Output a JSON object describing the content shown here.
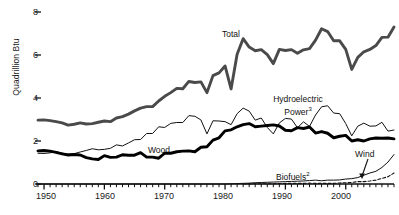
{
  "chart_data": {
    "type": "line",
    "title": "",
    "xlabel": "",
    "ylabel": "Quadrillion Btu",
    "xlim": [
      1949,
      2008
    ],
    "ylim": [
      0,
      8
    ],
    "yticks": [
      0,
      2,
      4,
      6,
      8
    ],
    "xticks": [
      1950,
      1960,
      1970,
      1980,
      1990,
      2000
    ],
    "minor_tick_interval": 1,
    "grid": false,
    "legend": "inline-annotations",
    "series": [
      {
        "name": "Total",
        "style": "thick-gray",
        "color": "#4a4a4a",
        "x": [
          1949,
          1950,
          1951,
          1952,
          1953,
          1954,
          1955,
          1956,
          1957,
          1958,
          1959,
          1960,
          1961,
          1962,
          1963,
          1964,
          1965,
          1966,
          1967,
          1968,
          1969,
          1970,
          1971,
          1972,
          1973,
          1974,
          1975,
          1976,
          1977,
          1978,
          1979,
          1980,
          1981,
          1982,
          1983,
          1984,
          1985,
          1986,
          1987,
          1988,
          1989,
          1990,
          1991,
          1992,
          1993,
          1994,
          1995,
          1996,
          1997,
          1998,
          1999,
          2000,
          2001,
          2002,
          2003,
          2004,
          2005,
          2006,
          2007,
          2008
        ],
        "values": [
          2.97,
          2.98,
          2.95,
          2.9,
          2.84,
          2.74,
          2.78,
          2.84,
          2.79,
          2.81,
          2.87,
          2.93,
          2.9,
          3.07,
          3.13,
          3.25,
          3.4,
          3.53,
          3.6,
          3.6,
          3.86,
          4.08,
          4.25,
          4.45,
          4.43,
          4.77,
          4.72,
          4.75,
          4.25,
          5.04,
          5.17,
          5.49,
          4.42,
          6.03,
          6.76,
          6.37,
          6.2,
          6.25,
          6.02,
          5.6,
          6.26,
          6.21,
          6.25,
          6.08,
          6.24,
          6.3,
          6.69,
          7.22,
          7.09,
          6.66,
          6.66,
          6.26,
          5.33,
          5.89,
          6.15,
          6.26,
          6.44,
          6.82,
          6.83,
          7.3
        ]
      },
      {
        "name": "Hydroelectric Power",
        "footnote": "3",
        "style": "thin-black",
        "color": "#111111",
        "x": [
          1949,
          1950,
          1951,
          1952,
          1953,
          1954,
          1955,
          1956,
          1957,
          1958,
          1959,
          1960,
          1961,
          1962,
          1963,
          1964,
          1965,
          1966,
          1967,
          1968,
          1969,
          1970,
          1971,
          1972,
          1973,
          1974,
          1975,
          1976,
          1977,
          1978,
          1979,
          1980,
          1981,
          1982,
          1983,
          1984,
          1985,
          1986,
          1987,
          1988,
          1989,
          1990,
          1991,
          1992,
          1993,
          1994,
          1995,
          1996,
          1997,
          1998,
          1999,
          2000,
          2001,
          2002,
          2003,
          2004,
          2005,
          2006,
          2007,
          2008
        ],
        "values": [
          1.43,
          1.42,
          1.45,
          1.5,
          1.44,
          1.39,
          1.41,
          1.49,
          1.56,
          1.64,
          1.59,
          1.61,
          1.66,
          1.82,
          1.77,
          1.91,
          2.06,
          2.07,
          2.35,
          2.35,
          2.66,
          2.63,
          2.82,
          2.86,
          2.86,
          3.18,
          3.15,
          2.98,
          2.33,
          2.94,
          2.93,
          2.9,
          2.76,
          3.27,
          3.53,
          3.39,
          2.97,
          3.07,
          2.63,
          2.33,
          2.84,
          3.05,
          3.02,
          2.62,
          2.89,
          2.68,
          3.21,
          3.59,
          3.64,
          3.3,
          3.27,
          2.81,
          2.24,
          2.69,
          2.83,
          2.69,
          2.7,
          2.87,
          2.46,
          2.51
        ]
      },
      {
        "name": "Wood",
        "style": "thick-black",
        "color": "#000000",
        "x": [
          1949,
          1950,
          1951,
          1952,
          1953,
          1954,
          1955,
          1956,
          1957,
          1958,
          1959,
          1960,
          1961,
          1962,
          1963,
          1964,
          1965,
          1966,
          1967,
          1968,
          1969,
          1970,
          1971,
          1972,
          1973,
          1974,
          1975,
          1976,
          1977,
          1978,
          1979,
          1980,
          1981,
          1982,
          1983,
          1984,
          1985,
          1986,
          1987,
          1988,
          1989,
          1990,
          1991,
          1992,
          1993,
          1994,
          1995,
          1996,
          1997,
          1998,
          1999,
          2000,
          2001,
          2002,
          2003,
          2004,
          2005,
          2006,
          2007,
          2008
        ],
        "values": [
          1.54,
          1.56,
          1.53,
          1.47,
          1.4,
          1.35,
          1.37,
          1.35,
          1.23,
          1.17,
          1.14,
          1.32,
          1.24,
          1.25,
          1.36,
          1.34,
          1.34,
          1.46,
          1.25,
          1.25,
          1.2,
          1.43,
          1.43,
          1.5,
          1.53,
          1.54,
          1.5,
          1.71,
          1.73,
          2.04,
          2.15,
          2.47,
          2.52,
          2.66,
          2.76,
          2.81,
          2.66,
          2.69,
          2.72,
          2.75,
          2.7,
          2.5,
          2.48,
          2.62,
          2.58,
          2.65,
          2.37,
          2.44,
          2.36,
          2.15,
          2.22,
          2.26,
          2.0,
          2.06,
          2.0,
          2.1,
          2.14,
          2.13,
          2.14,
          2.1
        ]
      },
      {
        "name": "Biofuels",
        "footnote": "2",
        "style": "thin-black",
        "color": "#111111",
        "x": [
          1949,
          1960,
          1970,
          1980,
          1981,
          1982,
          1983,
          1984,
          1985,
          1986,
          1987,
          1988,
          1989,
          1990,
          1991,
          1992,
          1993,
          1994,
          1995,
          1996,
          1997,
          1998,
          1999,
          2000,
          2001,
          2002,
          2003,
          2004,
          2005,
          2006,
          2007,
          2008
        ],
        "values": [
          0.0,
          0.0,
          0.0,
          0.0,
          0.01,
          0.02,
          0.03,
          0.04,
          0.06,
          0.07,
          0.08,
          0.09,
          0.1,
          0.11,
          0.12,
          0.13,
          0.14,
          0.16,
          0.18,
          0.15,
          0.18,
          0.18,
          0.19,
          0.23,
          0.25,
          0.3,
          0.41,
          0.51,
          0.59,
          0.77,
          1.02,
          1.37
        ]
      },
      {
        "name": "Wind",
        "style": "dashed-black",
        "color": "#111111",
        "x": [
          1983,
          1985,
          1987,
          1989,
          1990,
          1991,
          1992,
          1993,
          1994,
          1995,
          1996,
          1997,
          1998,
          1999,
          2000,
          2001,
          2002,
          2003,
          2004,
          2005,
          2006,
          2007,
          2008
        ],
        "values": [
          0.0,
          0.01,
          0.01,
          0.02,
          0.03,
          0.03,
          0.03,
          0.03,
          0.04,
          0.03,
          0.03,
          0.03,
          0.03,
          0.05,
          0.06,
          0.07,
          0.11,
          0.11,
          0.14,
          0.18,
          0.26,
          0.34,
          0.51
        ]
      }
    ],
    "annotations": [
      {
        "id": "total",
        "text": "Total"
      },
      {
        "id": "hydro1",
        "text": "Hydroelectric"
      },
      {
        "id": "hydro2",
        "text": "Power",
        "sup": "3"
      },
      {
        "id": "wood",
        "text": "Wood"
      },
      {
        "id": "wind",
        "text": "Wind"
      },
      {
        "id": "bio",
        "text": "Biofuels",
        "sup": "2"
      }
    ]
  }
}
